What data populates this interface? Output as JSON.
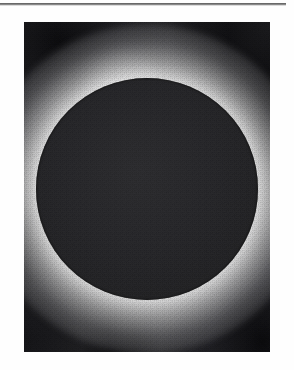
{
  "page": {
    "background_color": "#ffffff",
    "width": 294,
    "height": 370
  },
  "rule": {
    "name": "horizontal-rule",
    "color": "#3a3a3a",
    "x": 0,
    "y": 3,
    "width": 286,
    "height": 2
  },
  "figure": {
    "caption": "",
    "alt": "Total solar eclipse: dark lunar disk surrounded by a bright white corona",
    "frame": {
      "x": 24,
      "y": 22,
      "width": 246,
      "height": 330
    },
    "media_type": "halftone black-and-white photograph",
    "colors": {
      "disk": "#2b2b2e",
      "corona": "#ffffff",
      "sky": "#101012",
      "paper": "#ffffff"
    },
    "elements": [
      {
        "name": "lunar-disk",
        "shape": "circle",
        "center_x": 147,
        "center_y": 189,
        "radius": 111,
        "fill": "#2b2b2e"
      },
      {
        "name": "corona-glow",
        "shape": "radial-glow",
        "center_x": 147,
        "center_y": 189,
        "outer_radius": 165,
        "fill": "#ffffff"
      },
      {
        "name": "corona-streamer",
        "shape": "diffuse-plume",
        "direction": "upper-left",
        "fill": "#ffffff"
      },
      {
        "name": "sky-background",
        "shape": "corner-vignette",
        "corners": [
          "top-left",
          "bottom-right"
        ],
        "fill": "#101012"
      }
    ]
  }
}
